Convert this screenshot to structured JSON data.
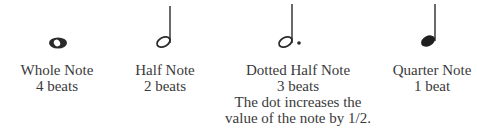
{
  "notes": [
    {
      "name": "Whole Note",
      "beats": "4 beats",
      "icon": "whole-note-icon"
    },
    {
      "name": "Half Note",
      "beats": "2 beats",
      "icon": "half-note-icon"
    },
    {
      "name": "Dotted Half Note",
      "beats": "3 beats",
      "note_line1": "The dot increases the",
      "note_line2": "value of the note by 1/2.",
      "icon": "dotted-half-note-icon"
    },
    {
      "name": "Quarter Note",
      "beats": "1 beat",
      "icon": "quarter-note-icon"
    }
  ],
  "colors": {
    "ink": "#2a2a2a",
    "text": "#3a3a3a"
  }
}
